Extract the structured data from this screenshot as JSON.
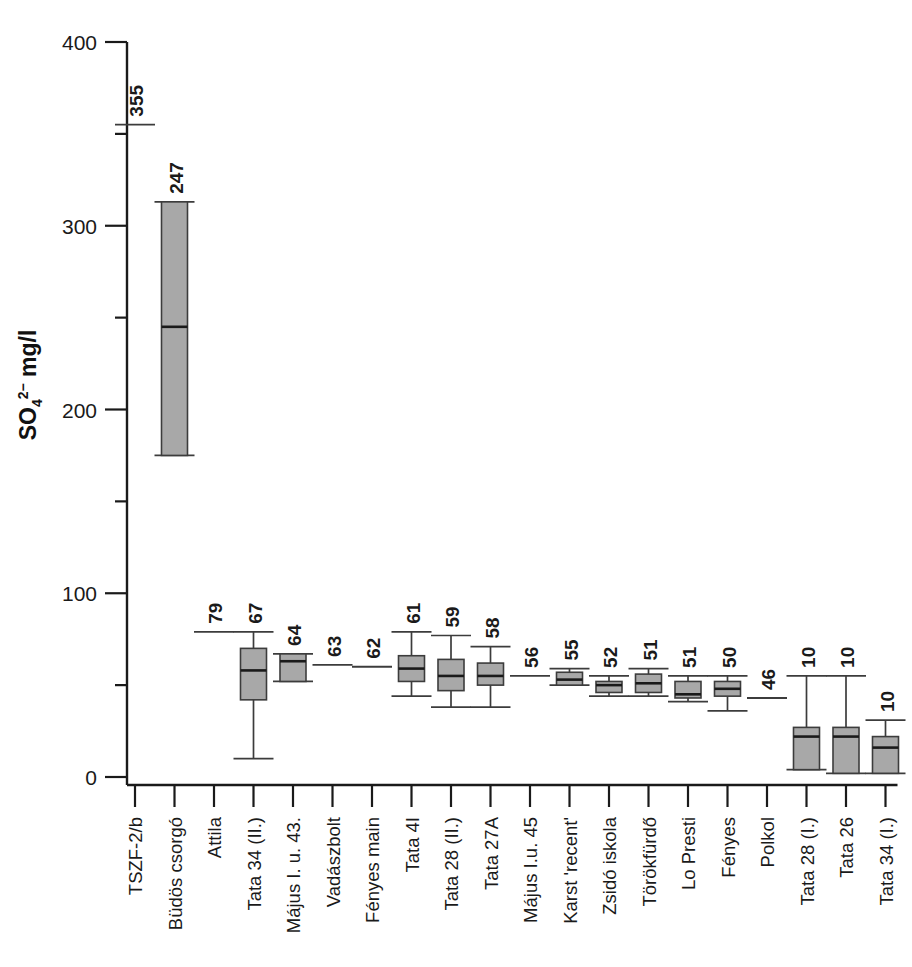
{
  "chart_data": {
    "type": "box",
    "title": "",
    "xlabel": "",
    "ylabel": "SO4 2- mg/l",
    "ylabel_main": "SO",
    "ylabel_sub": "4",
    "ylabel_sup": "2−",
    "ylabel_unit": " mg/l",
    "ylim": [
      0,
      400
    ],
    "ytick_labels": [
      "0",
      "100",
      "200",
      "300",
      "400"
    ],
    "ytick_values": [
      0,
      100,
      200,
      300,
      400
    ],
    "yminor_values": [
      50,
      150,
      250,
      350
    ],
    "grid": false,
    "legend": null,
    "categories": [
      "TSZF-2/b",
      "Büdös csorgó",
      "Attila",
      "Tata 34 (II.)",
      "Május I. u. 43.",
      "Vadászbolt",
      "Fényes main",
      "Tata 4I",
      "Tata 28 (II.)",
      "Tata 27A",
      "Május I.u. 45",
      "Karst 'recent'",
      "Zsidó iskola",
      "Törökfürdő",
      "Lo Presti",
      "Fényes",
      "Polkol",
      "Tata 28 (I.)",
      "Tata 26",
      "Tata 34 (I.)"
    ],
    "value_labels": [
      "355",
      "247",
      "79",
      "67",
      "64",
      "63",
      "62",
      "61",
      "59",
      "58",
      "56",
      "55",
      "52",
      "51",
      "51",
      "50",
      "46",
      "10",
      "10",
      "10"
    ],
    "boxes": [
      {
        "category": "TSZF-2/b",
        "label": "355",
        "median": 355,
        "q1": null,
        "q3": null,
        "low": null,
        "high": null,
        "single_line": true
      },
      {
        "category": "Büdös csorgó",
        "label": "247",
        "median": 245,
        "q1": 175,
        "q3": 313,
        "low": 175,
        "high": 313,
        "single_line": false
      },
      {
        "category": "Attila",
        "label": "79",
        "median": 79,
        "q1": null,
        "q3": null,
        "low": null,
        "high": null,
        "single_line": true
      },
      {
        "category": "Tata 34 (II.)",
        "label": "67",
        "median": 58,
        "q1": 42,
        "q3": 70,
        "low": 10,
        "high": 79,
        "single_line": false
      },
      {
        "category": "Május I. u. 43.",
        "label": "64",
        "median": 63,
        "q1": 52,
        "q3": 67,
        "low": 52,
        "high": 67,
        "single_line": false
      },
      {
        "category": "Vadászbolt",
        "label": "63",
        "median": 61,
        "q1": null,
        "q3": null,
        "low": null,
        "high": null,
        "single_line": true
      },
      {
        "category": "Fényes main",
        "label": "62",
        "median": 60,
        "q1": null,
        "q3": null,
        "low": null,
        "high": null,
        "single_line": true
      },
      {
        "category": "Tata 4I",
        "label": "61",
        "median": 59,
        "q1": 52,
        "q3": 66,
        "low": 44,
        "high": 79,
        "single_line": false
      },
      {
        "category": "Tata 28 (II.)",
        "label": "59",
        "median": 55,
        "q1": 47,
        "q3": 64,
        "low": 38,
        "high": 77,
        "single_line": false
      },
      {
        "category": "Tata 27A",
        "label": "58",
        "median": 55,
        "q1": 50,
        "q3": 62,
        "low": 38,
        "high": 71,
        "single_line": false
      },
      {
        "category": "Május I.u. 45",
        "label": "56",
        "median": 55,
        "q1": null,
        "q3": null,
        "low": null,
        "high": null,
        "single_line": true
      },
      {
        "category": "Karst 'recent'",
        "label": "55",
        "median": 53,
        "q1": 50,
        "q3": 57,
        "low": 50,
        "high": 59,
        "single_line": false
      },
      {
        "category": "Zsidó iskola",
        "label": "52",
        "median": 50,
        "q1": 46,
        "q3": 52,
        "low": 44,
        "high": 55,
        "single_line": false
      },
      {
        "category": "Törökfürdő",
        "label": "51",
        "median": 51,
        "q1": 46,
        "q3": 56,
        "low": 44,
        "high": 59,
        "single_line": false
      },
      {
        "category": "Lo Presti",
        "label": "51",
        "median": 45,
        "q1": 43,
        "q3": 52,
        "low": 41,
        "high": 55,
        "single_line": false
      },
      {
        "category": "Fényes",
        "label": "50",
        "median": 48,
        "q1": 44,
        "q3": 52,
        "low": 36,
        "high": 55,
        "single_line": false
      },
      {
        "category": "Polkol",
        "label": "46",
        "median": 43,
        "q1": null,
        "q3": null,
        "low": null,
        "high": null,
        "single_line": true
      },
      {
        "category": "Tata 28 (I.)",
        "label": "10",
        "median": 22,
        "q1": 4,
        "q3": 27,
        "low": 4,
        "high": 55,
        "single_line": false
      },
      {
        "category": "Tata 26",
        "label": "10",
        "median": 22,
        "q1": 2,
        "q3": 27,
        "low": 2,
        "high": 55,
        "single_line": false
      },
      {
        "category": "Tata 34 (I.)",
        "label": "10",
        "median": 16,
        "q1": 2,
        "q3": 22,
        "low": 2,
        "high": 31,
        "single_line": false
      }
    ]
  },
  "colors": {
    "box_fill": "#a8a8a8",
    "stroke": "#3c3c3c",
    "axis": "#1a1a1a",
    "background": "#ffffff"
  },
  "caption_fragment": ""
}
